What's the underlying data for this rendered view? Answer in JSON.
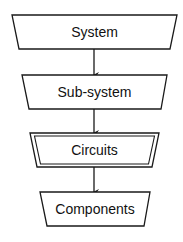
{
  "diagram": {
    "type": "hierarchy-flowchart",
    "direction": "top-to-bottom",
    "nodes": [
      {
        "id": "system",
        "label": "System",
        "shape": "inverted-trapezoid",
        "border": "single"
      },
      {
        "id": "sub-system",
        "label": "Sub-system",
        "shape": "inverted-trapezoid",
        "border": "single"
      },
      {
        "id": "circuits",
        "label": "Circuits",
        "shape": "inverted-trapezoid",
        "border": "double"
      },
      {
        "id": "components",
        "label": "Components",
        "shape": "inverted-trapezoid",
        "border": "single"
      }
    ],
    "edges": [
      {
        "from": "system",
        "to": "sub-system",
        "arrow": "down"
      },
      {
        "from": "sub-system",
        "to": "circuits",
        "arrow": "down"
      },
      {
        "from": "circuits",
        "to": "components",
        "arrow": "down"
      }
    ],
    "colors": {
      "stroke": "#1a1a1a",
      "fill": "#ffffff",
      "text": "#111111"
    }
  }
}
